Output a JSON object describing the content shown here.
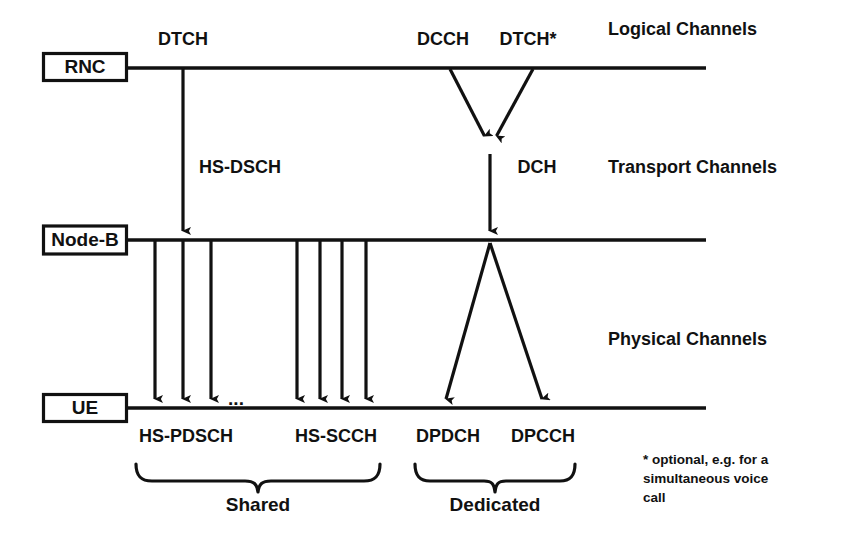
{
  "diagram": {
    "colors": {
      "line": "#111111",
      "text": "#111111",
      "background": "#ffffff"
    },
    "nodes": [
      {
        "id": "rnc",
        "label": "RNC",
        "x": 42,
        "y": 52,
        "w": 86,
        "h": 28,
        "line_y": 68
      },
      {
        "id": "nodeb",
        "label": "Node-B",
        "x": 42,
        "y": 225,
        "w": 86,
        "h": 30,
        "line_y": 240
      },
      {
        "id": "ue",
        "label": "UE",
        "x": 42,
        "y": 393,
        "w": 86,
        "h": 29,
        "line_y": 408
      }
    ],
    "section_labels": [
      {
        "id": "logical",
        "label": "Logical Channels",
        "x": 608,
        "y": 30
      },
      {
        "id": "transport",
        "label": "Transport Channels",
        "x": 608,
        "y": 168
      },
      {
        "id": "physical",
        "label": "Physical Channels",
        "x": 608,
        "y": 340
      }
    ],
    "logical_channels": [
      {
        "id": "dtch-left",
        "label": "DTCH",
        "x": 183,
        "y": 40
      },
      {
        "id": "dcch",
        "label": "DCCH",
        "x": 443,
        "y": 40
      },
      {
        "id": "dtch-star",
        "label": "DTCH*",
        "x": 528,
        "y": 40
      }
    ],
    "transport_channels": [
      {
        "id": "hs-dsch",
        "label": "HS-DSCH",
        "x": 240,
        "y": 168
      },
      {
        "id": "dch",
        "label": "DCH",
        "x": 537,
        "y": 168
      }
    ],
    "physical_channels": [
      {
        "id": "hs-pdsch",
        "label": "HS-PDSCH",
        "x": 186,
        "y": 437
      },
      {
        "id": "hs-scch",
        "label": "HS-SCCH",
        "x": 336,
        "y": 437
      },
      {
        "id": "dpdch",
        "label": "DPDCH",
        "x": 448,
        "y": 437
      },
      {
        "id": "dpcch",
        "label": "DPCCH",
        "x": 543,
        "y": 437
      }
    ],
    "ellipsis": {
      "label": "...",
      "x": 236,
      "y": 404
    },
    "groups": [
      {
        "id": "shared",
        "label": "Shared",
        "x": 258,
        "y": 504,
        "brace_left": 136,
        "brace_right": 380
      },
      {
        "id": "dedicated",
        "label": "Dedicated",
        "x": 495,
        "y": 504,
        "brace_left": 415,
        "brace_right": 575
      }
    ],
    "footnote": {
      "lines": [
        "* optional, e.g. for a",
        "simultaneous voice",
        "call"
      ],
      "x": 643,
      "y": 460
    },
    "arrows": {
      "hs_dsch_down": {
        "from_x": 183,
        "from_y": 68,
        "to_x": 183,
        "to_y": 238
      },
      "dcch_to_dch": {
        "from_x": 450,
        "from_y": 68,
        "to_x": 487,
        "to_y": 142
      },
      "dtch_star_to_dch": {
        "from_x": 533,
        "from_y": 68,
        "to_x": 494,
        "to_y": 142
      },
      "dch_down": {
        "from_x": 490,
        "from_y": 150,
        "to_x": 490,
        "to_y": 238
      },
      "hs_pdsch_columns_x": [
        155,
        183,
        211
      ],
      "hs_scch_columns_x": [
        297,
        320,
        342,
        366
      ],
      "dpdch_branch": {
        "from_x": 490,
        "from_y": 243,
        "to_x": 445,
        "to_y": 406
      },
      "dpcch_branch": {
        "from_x": 490,
        "from_y": 243,
        "to_x": 543,
        "to_y": 406
      }
    },
    "lines": {
      "x_start": 128,
      "x_end": 706
    }
  }
}
